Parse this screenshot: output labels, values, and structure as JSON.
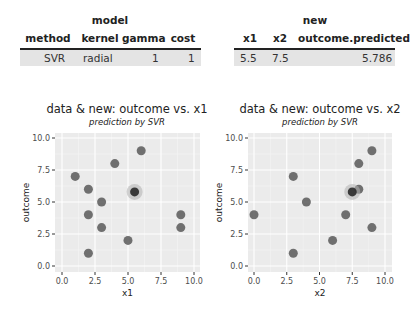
{
  "model_table": {
    "group_header": "model",
    "columns": [
      "method",
      "kernel",
      "gamma",
      "cost"
    ],
    "rows": [
      [
        "SVR",
        "radial",
        "1",
        "1"
      ]
    ]
  },
  "new_table": {
    "group_header": "new",
    "columns": [
      "x1",
      "x2",
      "outcome.predicted"
    ],
    "rows": [
      [
        "5.5",
        "7.5",
        "5.786"
      ]
    ]
  },
  "chart_data": [
    {
      "type": "scatter",
      "title": "data & new: outcome vs. x1",
      "subtitle": "prediction by SVR",
      "xlabel": "x1",
      "ylabel": "outcome",
      "xlim": [
        0,
        10
      ],
      "ylim": [
        0,
        10
      ],
      "xticks": [
        "0.0",
        "2.5",
        "5.0",
        "7.5",
        "10.0"
      ],
      "yticks": [
        "0.0",
        "2.5",
        "5.0",
        "7.5",
        "10.0"
      ],
      "grid": true,
      "series": [
        {
          "name": "data",
          "points": [
            [
              1,
              7
            ],
            [
              2,
              6
            ],
            [
              2,
              4
            ],
            [
              2,
              1
            ],
            [
              3,
              5
            ],
            [
              3,
              3
            ],
            [
              4,
              8
            ],
            [
              5,
              2
            ],
            [
              6,
              9
            ],
            [
              9,
              4
            ],
            [
              9,
              3
            ]
          ]
        },
        {
          "name": "new (predicted)",
          "points": [
            [
              5.5,
              5.786
            ]
          ]
        }
      ]
    },
    {
      "type": "scatter",
      "title": "data & new: outcome vs. x2",
      "subtitle": "prediction by SVR",
      "xlabel": "x2",
      "ylabel": "outcome",
      "xlim": [
        0,
        10
      ],
      "ylim": [
        0,
        10
      ],
      "xticks": [
        "0.0",
        "2.5",
        "5.0",
        "7.5",
        "10.0"
      ],
      "yticks": [
        "0.0",
        "2.5",
        "5.0",
        "7.5",
        "10.0"
      ],
      "grid": true,
      "series": [
        {
          "name": "data",
          "points": [
            [
              0,
              4
            ],
            [
              3,
              7
            ],
            [
              3,
              1
            ],
            [
              4,
              5
            ],
            [
              6,
              2
            ],
            [
              7,
              4
            ],
            [
              8,
              8
            ],
            [
              8,
              6
            ],
            [
              9,
              9
            ],
            [
              9,
              3
            ]
          ]
        },
        {
          "name": "new (predicted)",
          "points": [
            [
              7.5,
              5.786
            ]
          ]
        }
      ]
    }
  ]
}
